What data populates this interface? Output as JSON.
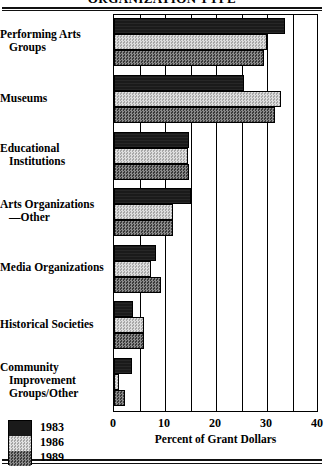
{
  "title": "ORGANIZATION TYPE",
  "chart_data": {
    "type": "bar",
    "orientation": "horizontal",
    "title": "ORGANIZATION TYPE",
    "xlabel": "Percent of Grant Dollars",
    "ylabel": "",
    "xlim": [
      0,
      40
    ],
    "xticks": [
      0,
      10,
      20,
      30,
      40
    ],
    "xtick_labels": [
      "0",
      "10",
      "20",
      "30",
      "40"
    ],
    "gridlines": [
      5,
      10,
      15,
      20,
      25,
      30,
      35
    ],
    "grid": true,
    "legend_position": "bottom-left",
    "categories": [
      "Performing Arts Groups",
      "Museums",
      "Educational Institutions",
      "Arts Organizations—Other",
      "Media Organizations",
      "Historical Societies",
      "Community Improvement Groups/Other"
    ],
    "series": [
      {
        "name": "1983",
        "color": "#1a1a1a",
        "values": [
          33.5,
          25.5,
          14.8,
          15.0,
          8.2,
          3.7,
          3.5
        ]
      },
      {
        "name": "1986",
        "color": "#c9c9c9",
        "values": [
          30.0,
          32.8,
          14.5,
          11.5,
          7.2,
          5.8,
          1.0
        ]
      },
      {
        "name": "1989",
        "color": "#6d6d6d",
        "values": [
          29.5,
          31.5,
          14.8,
          11.5,
          9.2,
          5.8,
          2.1
        ]
      }
    ]
  },
  "categories_display": [
    {
      "lines": [
        {
          "text": "Performing Arts",
          "indent": false
        },
        {
          "text": "Groups",
          "indent": true
        }
      ]
    },
    {
      "lines": [
        {
          "text": "Museums",
          "indent": false
        }
      ]
    },
    {
      "lines": [
        {
          "text": "Educational",
          "indent": false
        },
        {
          "text": "Institutions",
          "indent": true
        }
      ]
    },
    {
      "lines": [
        {
          "text": "Arts Organizations",
          "indent": false
        },
        {
          "text": "—Other",
          "indent": true
        }
      ]
    },
    {
      "lines": [
        {
          "text": "Media Organizations",
          "indent": false
        }
      ]
    },
    {
      "lines": [
        {
          "text": "Historical Societies",
          "indent": false
        }
      ]
    },
    {
      "lines": [
        {
          "text": "Community",
          "indent": false
        },
        {
          "text": "Improvement",
          "indent": true
        },
        {
          "text": "Groups/Other",
          "indent": true
        }
      ]
    }
  ],
  "legend": {
    "items": [
      {
        "label": "1983",
        "color": "#1a1a1a"
      },
      {
        "label": "1986",
        "color": "#c9c9c9"
      },
      {
        "label": "1989",
        "color": "#6d6d6d"
      }
    ]
  },
  "axis": {
    "x_title": "Percent of Grant Dollars",
    "tick_labels": [
      "0",
      "10",
      "20",
      "30",
      "40"
    ]
  }
}
